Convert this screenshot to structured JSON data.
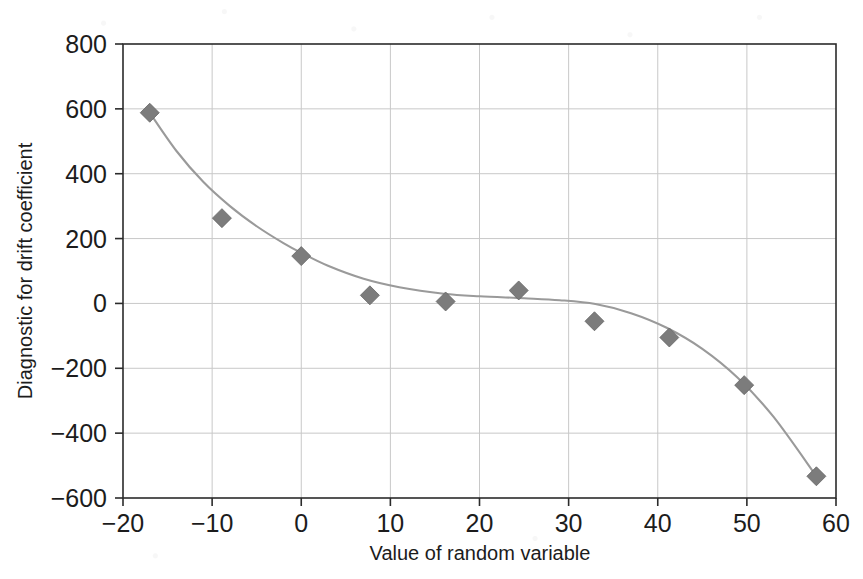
{
  "chart_data": {
    "type": "scatter",
    "title": "",
    "xlabel": "Value of random variable",
    "ylabel": "Diagnostic for drift coefficient",
    "xlim": [
      -20,
      60
    ],
    "ylim": [
      -600,
      800
    ],
    "xticks": [
      -20,
      -10,
      0,
      10,
      20,
      30,
      40,
      50,
      60
    ],
    "xtick_labels": [
      "-20",
      "-10",
      "0",
      "10",
      "20",
      "30",
      "40",
      "50",
      "60"
    ],
    "yticks": [
      -600,
      -400,
      -200,
      0,
      200,
      400,
      600,
      800
    ],
    "ytick_labels": [
      "-600",
      "-400",
      "-200",
      "0",
      "200",
      "400",
      "600",
      "800"
    ],
    "grid": true,
    "legend": "none",
    "marker": "diamond",
    "marker_color": "#7c7c7c",
    "line_color": "#9a9a9a",
    "frame_color": "#2b2b2b",
    "grid_color": "#c8c8c8",
    "series": [
      {
        "name": "Diagnostic for drift coefficient",
        "x": [
          -17.0,
          -8.9,
          0.0,
          7.7,
          16.2,
          24.4,
          32.9,
          41.3,
          49.7,
          57.8
        ],
        "y": [
          588,
          263,
          146,
          25,
          6,
          40,
          -55,
          -105,
          -252,
          -533
        ]
      }
    ],
    "fit_curve": {
      "name": "smoothed fit",
      "x": [
        -17.0,
        -14.0,
        -11.0,
        -8.0,
        -5.0,
        -2.0,
        0.0,
        3.0,
        7.0,
        11.0,
        16.0,
        20.0,
        25.0,
        29.0,
        33.0,
        37.0,
        41.0,
        45.0,
        49.0,
        53.0,
        57.8
      ],
      "y": [
        588,
        470,
        375,
        300,
        238,
        186,
        156,
        116,
        76,
        50,
        30,
        22,
        16,
        10,
        -2,
        -30,
        -75,
        -140,
        -230,
        -350,
        -533
      ]
    }
  }
}
